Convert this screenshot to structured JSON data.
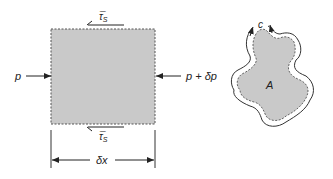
{
  "left_figure": {
    "name": "control-volume-element",
    "inlet_pressure_label": "p",
    "outlet_pressure_label": "p + δp",
    "shear_top_label": "τ̅",
    "shear_top_subscript": "S",
    "shear_bottom_label": "τ̅",
    "shear_bottom_subscript": "S",
    "length_label": "δx",
    "fill_color": "#c8c8c8",
    "line_color": "#333333"
  },
  "right_figure": {
    "name": "cross-section",
    "area_label": "A",
    "perimeter_label": "c",
    "fill_color": "#c8c8c8",
    "line_color": "#333333"
  }
}
